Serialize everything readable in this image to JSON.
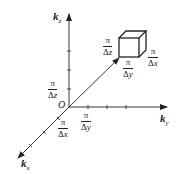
{
  "diagram": {
    "type": "3d-k-space-axes",
    "colors": {
      "stroke": "#222222",
      "background": "#ffffff"
    },
    "origin_label": "O",
    "axes": [
      {
        "id": "kz",
        "bold": "k",
        "sub": "z",
        "direction": "up"
      },
      {
        "id": "ky",
        "bold": "k",
        "sub": "y",
        "direction": "right"
      },
      {
        "id": "kx",
        "bold": "k",
        "sub": "x",
        "direction": "down-left"
      }
    ],
    "axis_fraction_labels": {
      "z": {
        "num": "π",
        "den_delta": "Δ",
        "den_var": "z"
      },
      "y": {
        "num": "π",
        "den_delta": "Δ",
        "den_var": "y"
      },
      "x": {
        "num": "π",
        "den_delta": "Δ",
        "den_var": "x"
      }
    },
    "cube_fraction_labels": {
      "z": {
        "num": "π",
        "den_delta": "Δ",
        "den_var": "z"
      },
      "y": {
        "num": "π",
        "den_delta": "Δ",
        "den_var": "y"
      },
      "x": {
        "num": "π",
        "den_delta": "Δ",
        "den_var": "x"
      }
    }
  }
}
